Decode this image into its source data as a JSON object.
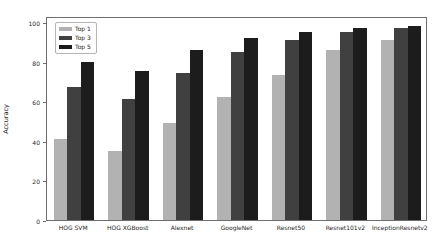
{
  "figure": {
    "background": "#ffffff",
    "spine_color": "#6e6e6e",
    "text_color": "#262626"
  },
  "chart_data": {
    "type": "bar",
    "title": "",
    "xlabel": "",
    "ylabel": "Accuracy",
    "categories": [
      "HOG SVM",
      "HOG XGBoost",
      "Alexnet",
      "GoogleNet",
      "Resnet50",
      "Resnet101v2",
      "InceptionResnetv2"
    ],
    "series": [
      {
        "name": "Top 1",
        "color": "#b2b2b2",
        "values": [
          41,
          35,
          49,
          62,
          73,
          86,
          91
        ]
      },
      {
        "name": "Top 3",
        "color": "#404040",
        "values": [
          67,
          61,
          74,
          85,
          91,
          95,
          97
        ]
      },
      {
        "name": "Top 5",
        "color": "#1c1c1c",
        "values": [
          80,
          75,
          86,
          92,
          95,
          97,
          98
        ]
      }
    ],
    "yticks": [
      0,
      20,
      40,
      60,
      80,
      100
    ],
    "ylim": [
      0,
      103
    ],
    "grid": false,
    "legend_position": "upper left"
  }
}
